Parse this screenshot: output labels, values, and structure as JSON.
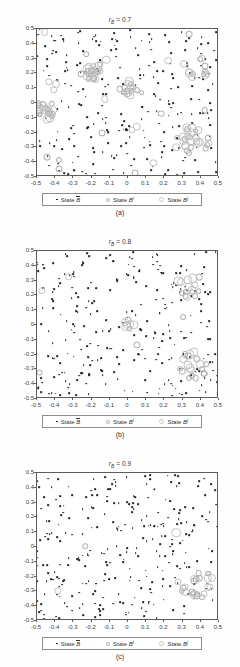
{
  "figure": {
    "panels": [
      {
        "id": "panel-a",
        "title_prefix": "r",
        "title_sub": "B",
        "title_eq": " = 0.7",
        "title_full": "r_B = 0.7",
        "caption": "(a)"
      },
      {
        "id": "panel-b",
        "title_prefix": "r",
        "title_sub": "B",
        "title_eq": " = 0.8",
        "title_full": "r_B = 0.8",
        "caption": "(b)"
      },
      {
        "id": "panel-c",
        "title_prefix": "r",
        "title_sub": "B",
        "title_eq": " = 0.9",
        "title_full": "r_B = 0.9",
        "caption": "(c)"
      }
    ],
    "legend": {
      "items": [
        {
          "marker": "filled-dot-marker",
          "label_prefix": "State ",
          "label_var": "B",
          "label_sup": "",
          "overbar": true
        },
        {
          "marker": "small-open-circle-marker",
          "label_prefix": "State ",
          "label_var": "B",
          "label_sup": "i",
          "overbar": false
        },
        {
          "marker": "large-open-circle-marker",
          "label_prefix": "State ",
          "label_var": "B",
          "label_sup": "j",
          "overbar": false
        }
      ]
    },
    "colors": {
      "dot": "#242424",
      "circle_i": "#a9a9a9",
      "circle_j": "#c2c2c2",
      "axis": "#5d5d5d",
      "background": "#ffffff"
    }
  },
  "chart_data": {
    "type": "scatter",
    "xlabel": "",
    "ylabel": "",
    "xlim": [
      -0.5,
      0.5
    ],
    "ylim": [
      -0.5,
      0.5
    ],
    "xticks": [
      -0.5,
      -0.4,
      -0.3,
      -0.2,
      -0.1,
      0,
      0.1,
      0.2,
      0.3,
      0.4,
      0.5
    ],
    "yticks": [
      0.5,
      0.4,
      0.3,
      0.2,
      0.1,
      0,
      -0.1,
      -0.2,
      -0.3,
      -0.4,
      -0.5
    ],
    "xticklabels": [
      "-0.5",
      "-0.4",
      "-0.3",
      "-0.2",
      "-0.1",
      "0",
      "0.1",
      "0.2",
      "0.3",
      "0.4",
      "0.5"
    ],
    "yticklabels": [
      "0.5",
      "0.4",
      "0.3",
      "0.2",
      "0.1",
      "0",
      "-0.1",
      "-0.2",
      "-0.3",
      "-0.4",
      "-0.5"
    ],
    "grid": false,
    "legend_position": "below-axes",
    "panels": [
      {
        "label": "(a)",
        "param_name": "r_B",
        "param_value": 0.7,
        "series": [
          {
            "name": "State B-bar",
            "marker": "dot",
            "count": 248,
            "points": [
              [
                -0.487,
                0.47
              ],
              [
                -0.463,
                0.39
              ],
              [
                -0.455,
                0.3
              ],
              [
                -0.45,
                -0.106
              ],
              [
                -0.444,
                -0.26
              ],
              [
                -0.438,
                -0.355
              ],
              [
                -0.43,
                -0.43
              ],
              [
                -0.423,
                0.455
              ],
              [
                -0.418,
                0.42
              ],
              [
                -0.41,
                0.355
              ],
              [
                -0.403,
                0.165
              ],
              [
                -0.398,
                -0.04
              ],
              [
                -0.39,
                -0.18
              ],
              [
                -0.383,
                -0.265
              ],
              [
                -0.377,
                -0.313
              ],
              [
                -0.37,
                -0.46
              ],
              [
                -0.362,
                0.468
              ],
              [
                -0.355,
                0.425
              ],
              [
                -0.349,
                0.408
              ],
              [
                -0.341,
                0.335
              ],
              [
                -0.333,
                0.21
              ],
              [
                -0.327,
                0.12
              ],
              [
                -0.32,
                -0.02
              ],
              [
                -0.313,
                -0.15
              ],
              [
                -0.305,
                -0.22
              ],
              [
                -0.298,
                -0.3
              ],
              [
                -0.29,
                -0.39
              ],
              [
                -0.283,
                -0.468
              ],
              [
                -0.277,
                0.46
              ],
              [
                -0.27,
                0.412
              ],
              [
                -0.262,
                0.345
              ],
              [
                -0.256,
                0.28
              ],
              [
                -0.248,
                0.2
              ],
              [
                -0.241,
                0.1
              ],
              [
                -0.233,
                0.03
              ],
              [
                -0.226,
                -0.08
              ],
              [
                -0.22,
                -0.17
              ],
              [
                -0.212,
                -0.24
              ],
              [
                -0.205,
                -0.31
              ],
              [
                -0.198,
                -0.41
              ],
              [
                -0.19,
                -0.47
              ],
              [
                -0.183,
                0.47
              ],
              [
                -0.176,
                0.45
              ],
              [
                -0.168,
                0.4
              ],
              [
                -0.162,
                0.3
              ],
              [
                -0.155,
                0.225
              ],
              [
                -0.147,
                0.155
              ],
              [
                -0.14,
                0.06
              ],
              [
                -0.133,
                -0.03
              ],
              [
                -0.126,
                -0.12
              ],
              [
                -0.118,
                -0.19
              ],
              [
                -0.112,
                -0.195
              ],
              [
                -0.105,
                -0.2
              ],
              [
                -0.098,
                -0.28
              ],
              [
                -0.09,
                -0.36
              ],
              [
                -0.083,
                -0.44
              ],
              [
                -0.076,
                0.465
              ],
              [
                -0.069,
                0.43
              ],
              [
                -0.062,
                0.37
              ],
              [
                -0.055,
                0.31
              ],
              [
                -0.048,
                0.23
              ],
              [
                -0.04,
                0.14
              ],
              [
                -0.033,
                0.05
              ],
              [
                -0.026,
                -0.06
              ],
              [
                -0.019,
                -0.14
              ],
              [
                -0.012,
                -0.185
              ],
              [
                -0.005,
                -0.19
              ],
              [
                0.002,
                -0.26
              ],
              [
                0.009,
                -0.34
              ],
              [
                0.016,
                -0.42
              ],
              [
                0.023,
                0.48
              ],
              [
                0.03,
                0.44
              ],
              [
                0.037,
                0.38
              ],
              [
                0.044,
                0.315
              ],
              [
                0.051,
                0.235
              ],
              [
                0.058,
                0.16
              ],
              [
                0.065,
                0.07
              ],
              [
                0.072,
                -0.02
              ],
              [
                0.079,
                -0.1
              ],
              [
                0.086,
                -0.18
              ],
              [
                0.093,
                -0.24
              ],
              [
                0.1,
                -0.3
              ],
              [
                0.107,
                -0.38
              ],
              [
                0.114,
                -0.45
              ],
              [
                0.121,
                0.47
              ],
              [
                0.128,
                0.43
              ],
              [
                0.135,
                0.36
              ],
              [
                0.142,
                0.29
              ],
              [
                0.149,
                0.21
              ],
              [
                0.156,
                0.13
              ],
              [
                0.163,
                0.04
              ],
              [
                0.17,
                -0.05
              ],
              [
                0.177,
                -0.13
              ],
              [
                0.184,
                -0.21
              ],
              [
                0.191,
                -0.29
              ],
              [
                0.198,
                -0.37
              ],
              [
                0.205,
                -0.46
              ],
              [
                0.212,
                0.46
              ],
              [
                0.219,
                0.41
              ],
              [
                0.226,
                0.34
              ],
              [
                0.233,
                0.26
              ],
              [
                0.24,
                0.18
              ],
              [
                0.247,
                0.1
              ],
              [
                0.254,
                0.01
              ],
              [
                0.261,
                -0.07
              ],
              [
                0.268,
                -0.15
              ],
              [
                0.275,
                -0.23
              ],
              [
                0.282,
                -0.31
              ],
              [
                0.289,
                -0.39
              ],
              [
                0.296,
                -0.47
              ],
              [
                0.303,
                0.47
              ],
              [
                0.31,
                0.42
              ],
              [
                0.317,
                0.35
              ],
              [
                0.324,
                0.27
              ],
              [
                0.331,
                0.19
              ],
              [
                0.338,
                0.11
              ],
              [
                0.345,
                0.02
              ],
              [
                0.352,
                -0.06
              ],
              [
                0.359,
                -0.14
              ],
              [
                0.366,
                -0.22
              ],
              [
                0.373,
                -0.3
              ],
              [
                0.38,
                -0.38
              ],
              [
                0.387,
                -0.46
              ],
              [
                0.394,
                0.46
              ],
              [
                0.401,
                0.41
              ],
              [
                0.408,
                0.33
              ],
              [
                0.415,
                0.25
              ],
              [
                0.422,
                0.17
              ],
              [
                0.429,
                0.09
              ],
              [
                0.436,
                0
              ],
              [
                0.443,
                -0.08
              ],
              [
                0.45,
                -0.16
              ],
              [
                0.457,
                -0.24
              ],
              [
                0.464,
                -0.32
              ],
              [
                0.471,
                -0.4
              ],
              [
                0.478,
                -0.48
              ],
              [
                0.485,
                0.47
              ]
            ]
          },
          {
            "name": "State B-i",
            "marker": "circle-small",
            "count": 62
          },
          {
            "name": "State B-j",
            "marker": "circle-large",
            "count": 58
          }
        ],
        "cluster_regions": [
          {
            "cx": -0.47,
            "cy": -0.05,
            "r": 0.07,
            "density": "high"
          },
          {
            "cx": -0.2,
            "cy": 0.2,
            "r": 0.06,
            "density": "medium"
          },
          {
            "cx": 0.0,
            "cy": 0.1,
            "r": 0.06,
            "density": "medium"
          },
          {
            "cx": 0.35,
            "cy": -0.26,
            "r": 0.1,
            "density": "high"
          },
          {
            "cx": 0.38,
            "cy": 0.25,
            "r": 0.08,
            "density": "medium"
          }
        ]
      },
      {
        "label": "(b)",
        "param_name": "r_B",
        "param_value": 0.8,
        "series": [
          {
            "name": "State B-bar",
            "marker": "dot",
            "count": 268
          },
          {
            "name": "State B-i",
            "marker": "circle-small",
            "count": 24
          },
          {
            "name": "State B-j",
            "marker": "circle-large",
            "count": 22
          }
        ],
        "cluster_regions": [
          {
            "cx": 0.34,
            "cy": 0.26,
            "r": 0.08,
            "density": "medium"
          },
          {
            "cx": 0.36,
            "cy": -0.27,
            "r": 0.09,
            "density": "high"
          },
          {
            "cx": 0.0,
            "cy": 0.0,
            "r": 0.04,
            "density": "low"
          }
        ]
      },
      {
        "label": "(c)",
        "param_name": "r_B",
        "param_value": 0.9,
        "series": [
          {
            "name": "State B-bar",
            "marker": "dot",
            "count": 288
          },
          {
            "name": "State B-i",
            "marker": "circle-small",
            "count": 14
          },
          {
            "name": "State B-j",
            "marker": "circle-large",
            "count": 13
          }
        ],
        "cluster_regions": [
          {
            "cx": 0.37,
            "cy": -0.25,
            "r": 0.1,
            "density": "high"
          }
        ]
      }
    ]
  }
}
